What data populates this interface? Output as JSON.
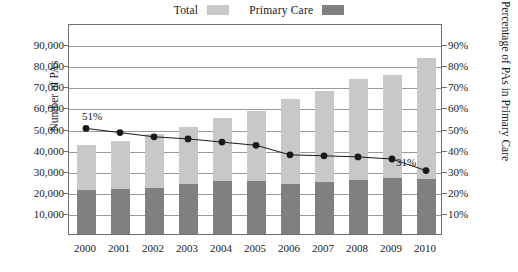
{
  "legend": {
    "entries": [
      {
        "label": "Total",
        "color": "#c8c8c8",
        "swatch_name": "legend-swatch-total"
      },
      {
        "label": "Primary Care",
        "color": "#808080",
        "swatch_name": "legend-swatch-primary-care"
      }
    ]
  },
  "axes": {
    "left_title": "Number of PAs",
    "right_title": "Percentage of PAs in Primary Care",
    "left_ticks": [
      "90,000",
      "80,000",
      "70,000",
      "60,000",
      "50,000",
      "40,000",
      "30,000",
      "20,000",
      "10,000"
    ],
    "right_ticks": [
      "90%",
      "80%",
      "70%",
      "60%",
      "50%",
      "40%",
      "30%",
      "20%",
      "10%"
    ]
  },
  "chart_data": {
    "type": "bar",
    "title": "",
    "subtitle": "",
    "xlabel": "",
    "ylabel": "Number of PAs",
    "y2label": "Percentage of PAs in Primary Care",
    "categories": [
      "2000",
      "2001",
      "2002",
      "2003",
      "2004",
      "2005",
      "2006",
      "2007",
      "2008",
      "2009",
      "2010"
    ],
    "stacked": true,
    "ylim": [
      0,
      100000
    ],
    "y2lim": [
      0,
      100
    ],
    "grid": true,
    "legend_position": "top-center",
    "series": [
      {
        "name": "Total",
        "type": "bar",
        "axis": "left",
        "color": "#c8c8c8",
        "values": [
          42000,
          44000,
          47500,
          50500,
          55000,
          58500,
          64000,
          68000,
          73500,
          75500,
          83500
        ]
      },
      {
        "name": "Primary Care",
        "type": "bar",
        "axis": "left",
        "color": "#808080",
        "values": [
          21000,
          21500,
          22000,
          23500,
          25000,
          25000,
          23500,
          24500,
          25500,
          26500,
          26000
        ]
      },
      {
        "name": "Percentage of PAs in Primary Care",
        "type": "line",
        "axis": "right",
        "color": "#1a1a1a",
        "values": [
          51,
          49,
          47,
          46,
          44.5,
          43,
          38.5,
          38,
          37.5,
          36.5,
          31
        ]
      }
    ],
    "annotations": [
      {
        "text": "51%",
        "category": "2000",
        "value": 51,
        "series": "Percentage of PAs in Primary Care"
      },
      {
        "text": "31%",
        "category": "2010",
        "value": 31,
        "series": "Percentage of PAs in Primary Care"
      }
    ]
  }
}
